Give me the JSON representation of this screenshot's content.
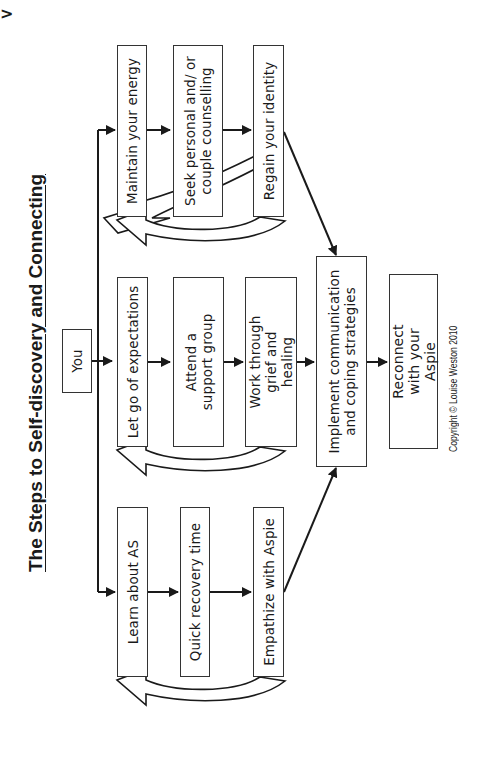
{
  "title": "The Steps to Self-discovery and Connecting",
  "start_node": "You",
  "columns": [
    {
      "id": "top",
      "steps": [
        "Maintain your energy",
        "Seek personal and/ or couple counselling",
        "Regain your identity"
      ]
    },
    {
      "id": "middle",
      "steps": [
        "Let go of expectations",
        "Attend a support group",
        "Work through grief and healing"
      ]
    },
    {
      "id": "bottom",
      "steps": [
        "Learn about AS",
        "Quick recovery time",
        "Empathize with Aspie"
      ]
    }
  ],
  "merge_node": "Implement communication and coping strategies",
  "final_node": "Reconnect with your Aspie",
  "copyright": "Copyright © Louise Weston 2010",
  "corner_mark": ">",
  "colors": {
    "line": "#1a1a1a",
    "box_border": "#333333",
    "background": "#ffffff"
  }
}
